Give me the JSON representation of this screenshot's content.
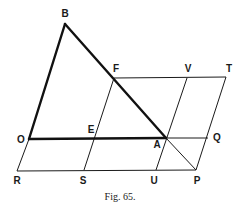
{
  "figure": {
    "caption": "Fig. 65.",
    "points": {
      "B": {
        "label": "B",
        "x": 65,
        "y": 24,
        "lx": 65,
        "ly": 17
      },
      "F": {
        "label": "F",
        "x": 114,
        "y": 78,
        "lx": 116,
        "ly": 72
      },
      "V": {
        "label": "V",
        "x": 187,
        "y": 78,
        "lx": 188,
        "ly": 72
      },
      "T": {
        "label": "T",
        "x": 226,
        "y": 77,
        "lx": 229,
        "ly": 72
      },
      "O": {
        "label": "O",
        "x": 29,
        "y": 139,
        "lx": 21,
        "ly": 143
      },
      "E": {
        "label": "E",
        "x": 95,
        "y": 138,
        "lx": 91,
        "ly": 133
      },
      "A": {
        "label": "A",
        "x": 166,
        "y": 138,
        "lx": 157,
        "ly": 148
      },
      "Q": {
        "label": "Q",
        "x": 208,
        "y": 138,
        "lx": 217,
        "ly": 141
      },
      "R": {
        "label": "R",
        "x": 17,
        "y": 171,
        "lx": 17,
        "ly": 184
      },
      "S": {
        "label": "S",
        "x": 84,
        "y": 170,
        "lx": 83,
        "ly": 184
      },
      "U": {
        "label": "U",
        "x": 156,
        "y": 170,
        "lx": 154,
        "ly": 184
      },
      "P": {
        "label": "P",
        "x": 196,
        "y": 170,
        "lx": 197,
        "ly": 184
      }
    },
    "thick_segments": [
      [
        "O",
        "B"
      ],
      [
        "B",
        "A"
      ],
      [
        "O",
        "A"
      ]
    ],
    "thin_segments": [
      [
        "F",
        "T"
      ],
      [
        "A",
        "Q"
      ],
      [
        "R",
        "P"
      ],
      [
        "R",
        "O"
      ],
      [
        "S",
        "F"
      ],
      [
        "U",
        "V"
      ],
      [
        "P",
        "T"
      ],
      [
        "A",
        "P"
      ]
    ]
  }
}
